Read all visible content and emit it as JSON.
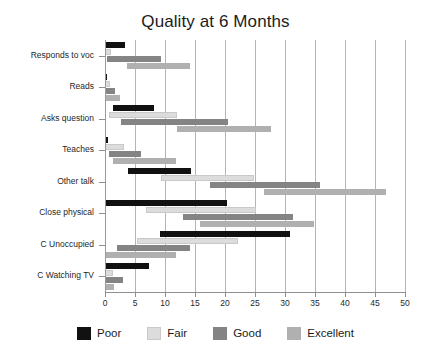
{
  "chart_data": {
    "type": "bar",
    "bar_style": "floating-range-horizontal",
    "title": "Quality at 6 Months",
    "xlabel": "",
    "ylabel": "",
    "xlim": [
      0,
      50
    ],
    "xticks": [
      0,
      5,
      10,
      15,
      20,
      25,
      30,
      35,
      40,
      45,
      50
    ],
    "xtick_labels": [
      "0",
      "5",
      "10",
      "15",
      "20",
      "25",
      "30",
      "35",
      "40",
      "45",
      "50"
    ],
    "grid": "vertical",
    "legend_position": "bottom",
    "orientation": "horizontal",
    "categories": [
      "Responds to voc",
      "Reads",
      "Asks question",
      "Teaches",
      "Other talk",
      "Close physical",
      "C Unoccupied",
      "C Watching TV"
    ],
    "series": [
      {
        "name": "Poor",
        "color": "#111111",
        "ranges": [
          [
            0.0,
            3.3
          ],
          [
            0.0,
            0.4
          ],
          [
            1.3,
            8.2
          ],
          [
            0.0,
            0.5
          ],
          [
            3.8,
            14.3
          ],
          [
            0.0,
            20.3
          ],
          [
            9.1,
            30.9
          ],
          [
            0.0,
            7.4
          ]
        ]
      },
      {
        "name": "Fair",
        "color": "#dcdcdc",
        "ranges": [
          [
            0.0,
            1.0
          ],
          [
            0.0,
            0.8
          ],
          [
            0.6,
            12.0
          ],
          [
            0.0,
            3.2
          ],
          [
            9.3,
            24.9
          ],
          [
            6.8,
            25.1
          ],
          [
            5.4,
            22.1
          ],
          [
            0.0,
            1.4
          ]
        ]
      },
      {
        "name": "Good",
        "color": "#848484",
        "ranges": [
          [
            0.4,
            9.3
          ],
          [
            0.1,
            1.7
          ],
          [
            2.7,
            20.5
          ],
          [
            0.7,
            6.0
          ],
          [
            17.5,
            35.9
          ],
          [
            13.0,
            31.4
          ],
          [
            2.0,
            14.2
          ],
          [
            0.2,
            3.0
          ]
        ]
      },
      {
        "name": "Excellent",
        "color": "#b0b0b0",
        "ranges": [
          [
            3.6,
            14.1
          ],
          [
            0.0,
            2.5
          ],
          [
            12.0,
            27.6
          ],
          [
            1.4,
            11.9
          ],
          [
            26.5,
            46.9
          ],
          [
            15.8,
            34.8
          ],
          [
            0.0,
            11.8
          ],
          [
            0.0,
            1.5
          ]
        ]
      }
    ]
  },
  "legend": {
    "items": [
      {
        "label": "Poor",
        "color": "#111111"
      },
      {
        "label": "Fair",
        "color": "#dcdcdc"
      },
      {
        "label": "Good",
        "color": "#848484"
      },
      {
        "label": "Excellent",
        "color": "#b0b0b0"
      }
    ]
  }
}
